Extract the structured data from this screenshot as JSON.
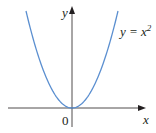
{
  "chart_data": {
    "type": "line",
    "title": "",
    "xlabel": "x",
    "ylabel": "y",
    "origin_label": "0",
    "series": [
      {
        "name": "y = x^2",
        "function": "x^2",
        "color": "#5b8fd0",
        "x": [
          -2,
          -1.5,
          -1,
          -0.5,
          0,
          0.5,
          1,
          1.5,
          2
        ],
        "values": [
          4,
          2.25,
          1,
          0.25,
          0,
          0.25,
          1,
          2.25,
          4
        ]
      }
    ],
    "grid": false,
    "legend": "none",
    "annotation": {
      "text": "y = x",
      "superscript": "2"
    }
  },
  "colors": {
    "curve": "#5b8fd0",
    "axis": "#231f20"
  }
}
